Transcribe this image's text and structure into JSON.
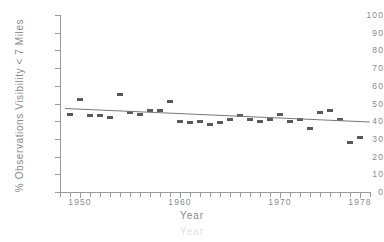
{
  "chart_data": {
    "type": "scatter",
    "title": "",
    "xlabel": "Year",
    "ylabel": "% Observations Visibility < 7 Miles",
    "xlim": [
      1948,
      1979
    ],
    "ylim": [
      0,
      100
    ],
    "grid": false,
    "legend": null,
    "y_ticks": [
      0,
      10,
      20,
      30,
      40,
      50,
      60,
      70,
      80,
      90,
      100
    ],
    "y_tick_labels": [
      "0",
      "10",
      "20",
      "30",
      "40",
      "50",
      "60",
      "70",
      "80",
      "90",
      "100"
    ],
    "x_ticks": [
      1950,
      1960,
      1970,
      1978
    ],
    "x_tick_labels": [
      "1950",
      "1960",
      "1970",
      "1978"
    ],
    "x_minor_tick_step": 1,
    "marker_style": "filled-square",
    "marker_color": "#5a5a5a",
    "trendline_color": "#777777",
    "axis_color": "#9a9a9a",
    "series": [
      {
        "name": "% Observations Visibility < 7 Miles",
        "x": [
          1949,
          1950,
          1951,
          1952,
          1953,
          1954,
          1955,
          1956,
          1957,
          1958,
          1959,
          1960,
          1961,
          1962,
          1963,
          1964,
          1965,
          1966,
          1967,
          1968,
          1969,
          1970,
          1971,
          1972,
          1973,
          1974,
          1975,
          1976,
          1977,
          1978
        ],
        "y": [
          44,
          52,
          43,
          43,
          42,
          55,
          45,
          44,
          46,
          46,
          51,
          40,
          39,
          40,
          38,
          39,
          41,
          43,
          41,
          40,
          41,
          44,
          40,
          41,
          36,
          45,
          46,
          41,
          28,
          31
        ]
      }
    ],
    "trendline": {
      "name": "linear fit",
      "x": [
        1948.5,
        1979
      ],
      "y": [
        47.2,
        39.6
      ]
    }
  },
  "axis_title_ghost": "Year"
}
